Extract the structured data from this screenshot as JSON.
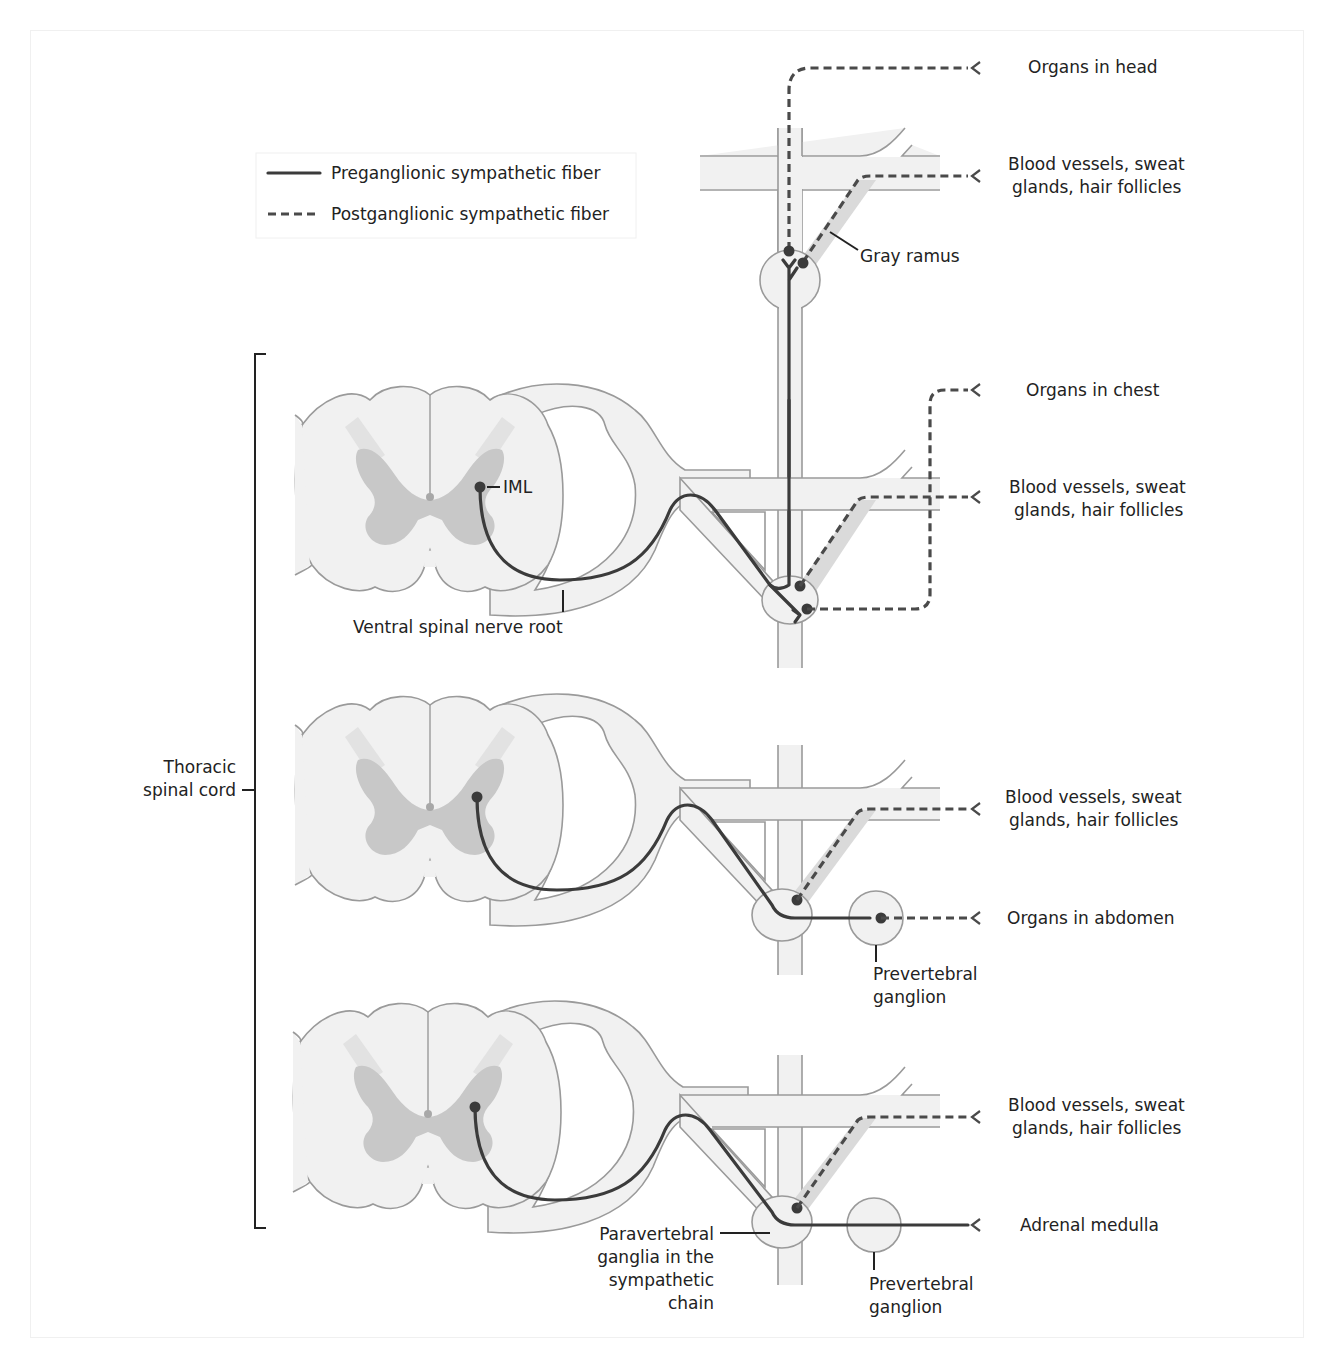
{
  "legend": {
    "preganglionic_label": "Preganglionic sympathetic fiber",
    "postganglionic_label": "Postganglionic sympathetic fiber",
    "preganglionic_style": "solid",
    "postganglionic_style": "dashed"
  },
  "targets": {
    "organs_head": "Organs in head",
    "level1_vessels_line1": "Blood vessels, sweat",
    "level1_vessels_line2": "glands, hair follicles",
    "organs_chest": "Organs in chest",
    "level2_vessels_line1": "Blood vessels, sweat",
    "level2_vessels_line2": "glands, hair follicles",
    "level3_vessels_line1": "Blood vessels, sweat",
    "level3_vessels_line2": "glands, hair follicles",
    "organs_abdomen": "Organs in abdomen",
    "level4_vessels_line1": "Blood vessels, sweat",
    "level4_vessels_line2": "glands, hair follicles",
    "adrenal_medulla": "Adrenal medulla"
  },
  "annotations": {
    "gray_ramus": "Gray ramus",
    "iml": "IML",
    "ventral_root": "Ventral spinal nerve root",
    "thoracic_line1": "Thoracic",
    "thoracic_line2": "spinal cord",
    "prevertebral1_line1": "Prevertebral",
    "prevertebral1_line2": "ganglion",
    "prevertebral2_line1": "Prevertebral",
    "prevertebral2_line2": "ganglion",
    "paravertebral_line1": "Paravertebral",
    "paravertebral_line2": "ganglia in the",
    "paravertebral_line3": "sympathetic",
    "paravertebral_line4": "chain"
  },
  "colors": {
    "tissue_fill": "#f1f1f1",
    "tissue_outline": "#9a9a9a",
    "gray_matter": "#c8c8c8",
    "fiber": "#3b3b3b",
    "text": "#222222"
  }
}
